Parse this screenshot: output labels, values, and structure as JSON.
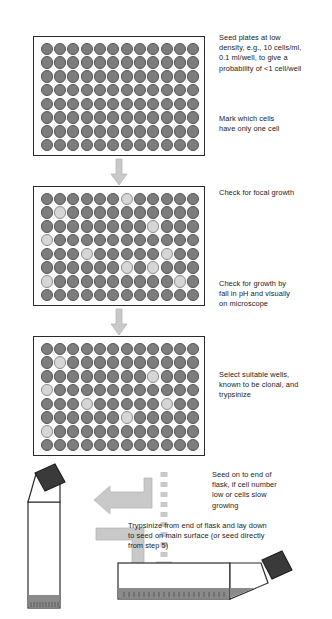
{
  "figure": {
    "type": "protocol-flow-diagram",
    "background_color": "#ffffff",
    "well_dark_color": "#7d7d7d",
    "well_light_color": "#d6d6d6",
    "arrow_color": "#c9c9c9",
    "flask_cap_color": "#3a3a3a",
    "flask_medium_color": "#8a8a8a",
    "outline_color": "#2b2b2b"
  },
  "steps": [
    {
      "id": "plate-1",
      "rows": 8,
      "columns": 12,
      "light_wells": [],
      "captions": [
        {
          "id": "caption-seed-plates",
          "text": "Seed plates at low\ndensity, e.g., 10 cells/ml,\n0.1 ml/well, to give a\nprobability of <1 cell/well"
        },
        {
          "id": "caption-mark-cells",
          "text": "Mark which cells\nhave only one cell"
        }
      ]
    },
    {
      "id": "plate-2",
      "rows": 8,
      "columns": 12,
      "light_wells": [
        [
          1,
          7
        ],
        [
          2,
          2
        ],
        [
          3,
          9
        ],
        [
          4,
          1
        ],
        [
          5,
          4
        ],
        [
          5,
          10
        ],
        [
          6,
          7
        ],
        [
          6,
          9
        ],
        [
          7,
          1
        ],
        [
          7,
          11
        ]
      ],
      "captions": [
        {
          "id": "caption-focal-growth",
          "text": "Check for focal growth"
        },
        {
          "id": "caption-check-growth",
          "text": "Check for growth by\nfall in pH and visually\non microscope"
        }
      ]
    },
    {
      "id": "plate-3",
      "rows": 8,
      "columns": 12,
      "light_wells": [
        [
          2,
          2
        ],
        [
          3,
          9
        ],
        [
          4,
          1
        ],
        [
          5,
          4
        ],
        [
          5,
          10
        ],
        [
          6,
          7
        ],
        [
          7,
          1
        ]
      ],
      "captions": [
        {
          "id": "caption-select-wells",
          "text": "Select suitable wells,\nknown to be clonal, and\ntrypsinize"
        }
      ]
    },
    {
      "id": "flask-stage",
      "captions": [
        {
          "id": "caption-seed-on-end",
          "text": "Seed on to end of\nflask, if cell number\nlow or cells slow\ngrowing"
        },
        {
          "id": "caption-trypsinize-flask",
          "text": "Trypsinize from end of flask and lay down\nto seed on main surface (or seed directly\nfrom step 5)"
        }
      ]
    }
  ]
}
